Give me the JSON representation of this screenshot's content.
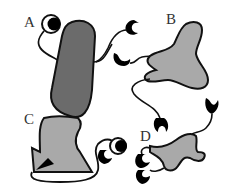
{
  "figure": {
    "labels": {
      "a": "A",
      "b": "B",
      "c": "C",
      "d": "D"
    },
    "colors": {
      "shape_dark": "#6b6b6b",
      "shape_light": "#a9a9a9",
      "outline": "#111111",
      "ink": "#000000"
    },
    "panels": [
      {
        "id": "A",
        "shape": "elongated-capsule",
        "fill": "dark",
        "appendages": [
          "eye-ring",
          "crescent-claw"
        ]
      },
      {
        "id": "B",
        "shape": "irregular-blob",
        "fill": "light",
        "appendages": [
          "crescent-claw",
          "crescent-claw",
          "crescent-claw"
        ]
      },
      {
        "id": "C",
        "shape": "notched-block-with-triangle",
        "fill": "light",
        "appendages": [
          "crescent-claw",
          "eye-ring"
        ]
      },
      {
        "id": "D",
        "shape": "winged-blob",
        "fill": "light",
        "appendages": [
          "crescent-claw",
          "crescent-claw",
          "crescent-claw"
        ]
      }
    ]
  }
}
